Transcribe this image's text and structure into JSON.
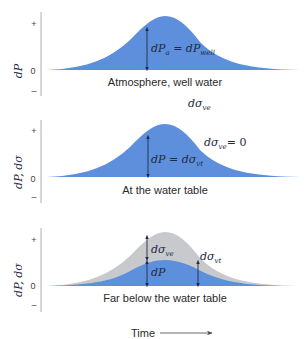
{
  "figure": {
    "x_axis_label": "Time",
    "colors": {
      "curve_blue": "#5e8fdc",
      "curve_gray": "#c7c9cc",
      "axis": "#9a9a9a",
      "text": "#2a2a2a"
    },
    "tick_labels": {
      "plus": "+",
      "zero": "0",
      "minus": "–"
    },
    "between_label_1": {
      "main": "dσ",
      "sub": "ve"
    },
    "panels": [
      {
        "y_label": "dP",
        "caption": "Atmosphere, well water",
        "eq_left_main": "dP",
        "eq_left_sub": "a",
        "eq_eq": " = ",
        "eq_right_main": "dP",
        "eq_right_sub": "well"
      },
      {
        "y_label": "dP, dσ",
        "caption": "At the water table",
        "eq_left_main": "dP",
        "eq_eq": " = ",
        "eq_right_main": "dσ",
        "eq_right_sub": "vt",
        "side_main": "dσ",
        "side_sub": "ve",
        "side_tail": "= 0"
      },
      {
        "y_label": "dP, dσ",
        "caption": "Far below the water table",
        "a1_main": "dσ",
        "a1_sub": "ve",
        "a2_main": "dP",
        "a3_main": "dσ",
        "a3_sub": "vt"
      }
    ]
  }
}
